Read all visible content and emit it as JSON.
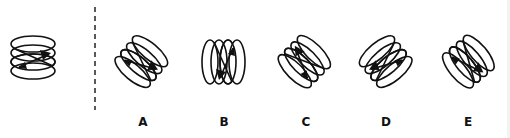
{
  "puzzle": {
    "type": "spatial-rotation",
    "reference": {
      "label": "",
      "rotation_deg": 0,
      "mirror": false
    },
    "separator": {
      "style": "dashed",
      "color": "#222222"
    },
    "options": [
      {
        "id": "A",
        "label": "A",
        "rotation_deg": 40,
        "mirror": false
      },
      {
        "id": "B",
        "label": "B",
        "rotation_deg": 90,
        "mirror": true
      },
      {
        "id": "C",
        "label": "C",
        "rotation_deg": -45,
        "mirror": false
      },
      {
        "id": "D",
        "label": "D",
        "rotation_deg": 35,
        "mirror": true
      },
      {
        "id": "E",
        "label": "E",
        "rotation_deg": -50,
        "mirror": true
      }
    ],
    "colors": {
      "stroke": "#111111",
      "background": "#ffffff"
    }
  }
}
